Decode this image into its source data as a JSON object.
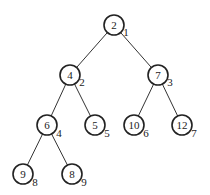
{
  "tree": {
    "nodes": [
      {
        "value": "2",
        "index": "1",
        "x": 114,
        "y": 25
      },
      {
        "value": "4",
        "index": "2",
        "x": 70,
        "y": 75
      },
      {
        "value": "7",
        "index": "3",
        "x": 158,
        "y": 75
      },
      {
        "value": "6",
        "index": "4",
        "x": 47,
        "y": 125
      },
      {
        "value": "5",
        "index": "5",
        "x": 95,
        "y": 125
      },
      {
        "value": "10",
        "index": "6",
        "x": 134,
        "y": 125
      },
      {
        "value": "12",
        "index": "7",
        "x": 182,
        "y": 125
      },
      {
        "value": "9",
        "index": "8",
        "x": 23,
        "y": 174
      },
      {
        "value": "8",
        "index": "9",
        "x": 72,
        "y": 174
      }
    ],
    "edges": [
      [
        0,
        1
      ],
      [
        0,
        2
      ],
      [
        1,
        3
      ],
      [
        1,
        4
      ],
      [
        2,
        5
      ],
      [
        2,
        6
      ],
      [
        3,
        7
      ],
      [
        3,
        8
      ]
    ]
  }
}
